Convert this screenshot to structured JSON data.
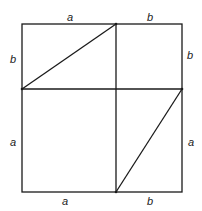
{
  "diagram": {
    "stroke_color": "#1a1a1a",
    "outer": {
      "x1": 22,
      "y1": 24,
      "x2": 182,
      "y2": 192
    },
    "dividers": {
      "vertical_x": 116,
      "horizontal_y": 89
    },
    "diagonals": [
      {
        "from": [
          22,
          89
        ],
        "to": [
          116,
          24
        ]
      },
      {
        "from": [
          116,
          192
        ],
        "to": [
          182,
          89
        ]
      }
    ],
    "labels": {
      "top_left": "a",
      "top_right": "b",
      "left_upper": "b",
      "right_upper": "b",
      "left_lower": "a",
      "right_lower": "a",
      "bottom_left": "a",
      "bottom_right": "b"
    }
  }
}
